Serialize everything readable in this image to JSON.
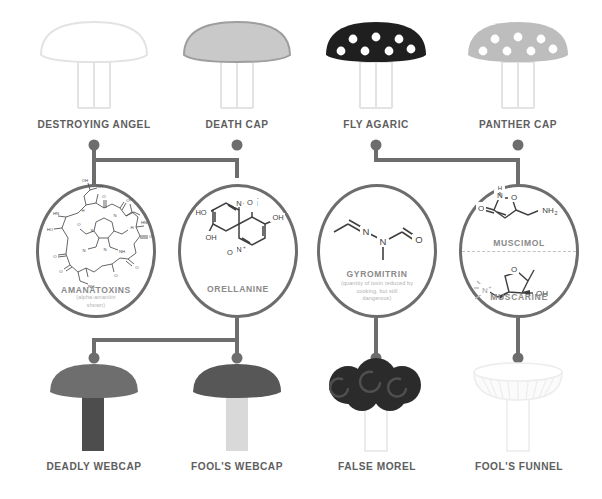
{
  "colors": {
    "line": "#6d6d6d",
    "label": "#5e5e5e",
    "toxin_name": "#8a8a8a",
    "toxin_sub": "#b0b0b0",
    "background": "#ffffff",
    "outline_pale": "#e8e8e8",
    "cap_death_cap": "#c9c9c9",
    "cap_fly_agaric": "#1f1f1f",
    "cap_panther_cap": "#bdbdbd",
    "cap_deadly_webcap": "#6e6e6e",
    "stem_deadly_webcap": "#4d4d4d",
    "cap_fools_webcap": "#575757",
    "stem_fools_webcap": "#d9d9d9",
    "cap_false_morel": "#2b2b2b",
    "cap_fools_funnel": "#efefef"
  },
  "top_row": {
    "mushrooms": [
      {
        "id": "destroying-angel",
        "label": "DESTROYING ANGEL",
        "style": "outline",
        "dots": false
      },
      {
        "id": "death-cap",
        "label": "DEATH CAP",
        "style": "filled-light",
        "dots": false
      },
      {
        "id": "fly-agaric",
        "label": "FLY AGARIC",
        "style": "filled-dark",
        "dots": true,
        "dot_count": 7
      },
      {
        "id": "panther-cap",
        "label": "PANTHER CAP",
        "style": "filled-mid",
        "dots": true,
        "dot_count": 7
      }
    ]
  },
  "toxins": [
    {
      "id": "amanatoxins",
      "name": "AMANATOXINS",
      "subtitle": "(alpha-amanitin\nshown)",
      "subtitle_lines": [
        "(alpha-amanitin",
        "shown)"
      ],
      "split": false
    },
    {
      "id": "orellanine",
      "name": "ORELLANINE",
      "subtitle": "",
      "subtitle_lines": [],
      "split": false
    },
    {
      "id": "gyromitrin",
      "name": "GYROMITRIN",
      "subtitle": "(quantity of toxin reduced by cooking, but still dangerous)",
      "subtitle_lines": [
        "(quantity of toxin reduced by",
        "cooking, but still",
        "dangerous)"
      ],
      "split": false
    },
    {
      "id": "muscimol-muscarine",
      "name": "MUSCIMOL",
      "name_lower": "MUSCARINE",
      "subtitle": "",
      "subtitle_lines": [],
      "split": true
    }
  ],
  "bottom_row": {
    "mushrooms": [
      {
        "id": "deadly-webcap",
        "label": "DEADLY WEBCAP",
        "style": "filled-dark-cap-dark-stem"
      },
      {
        "id": "fools-webcap",
        "label": "FOOL'S WEBCAP",
        "style": "filled-dark-cap-light-stem"
      },
      {
        "id": "false-morel",
        "label": "FALSE MOREL",
        "style": "lobed-dark"
      },
      {
        "id": "fools-funnel",
        "label": "FOOL'S FUNNEL",
        "style": "funnel-pale"
      }
    ]
  },
  "connections": [
    {
      "from": "destroying-angel",
      "to": "amanatoxins"
    },
    {
      "from": "death-cap",
      "to": "amanatoxins"
    },
    {
      "from": "fly-agaric",
      "to": "muscimol-muscarine"
    },
    {
      "from": "panther-cap",
      "to": "muscimol-muscarine"
    },
    {
      "from": "orellanine",
      "to": "deadly-webcap"
    },
    {
      "from": "orellanine",
      "to": "fools-webcap"
    },
    {
      "from": "gyromitrin",
      "to": "false-morel"
    },
    {
      "from": "muscimol-muscarine",
      "to": "fools-funnel"
    }
  ]
}
